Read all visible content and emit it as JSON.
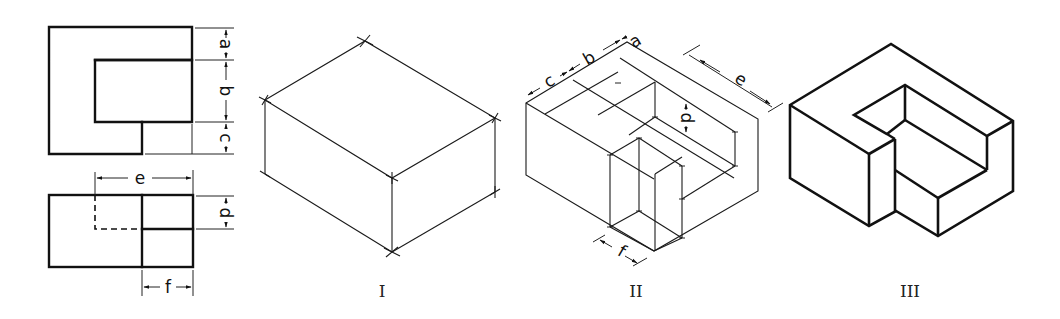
{
  "figure": {
    "ortho_views": {
      "top_view": {
        "dimensions": [
          "a",
          "b",
          "c"
        ]
      },
      "front_view": {
        "dimensions": [
          "e",
          "d",
          "f"
        ]
      }
    },
    "steps": [
      {
        "label": "I",
        "name": "bounding box"
      },
      {
        "label": "II",
        "name": "layout with dimensions",
        "dimensions": [
          "c",
          "b",
          "a",
          "e",
          "d",
          "f"
        ]
      },
      {
        "label": "III",
        "name": "finished isometric"
      }
    ],
    "dim_labels": {
      "a": "a",
      "b": "b",
      "c": "c",
      "d": "d",
      "e": "e",
      "f": "f"
    },
    "colors": {
      "line": "#111111",
      "background": "#ffffff"
    }
  }
}
